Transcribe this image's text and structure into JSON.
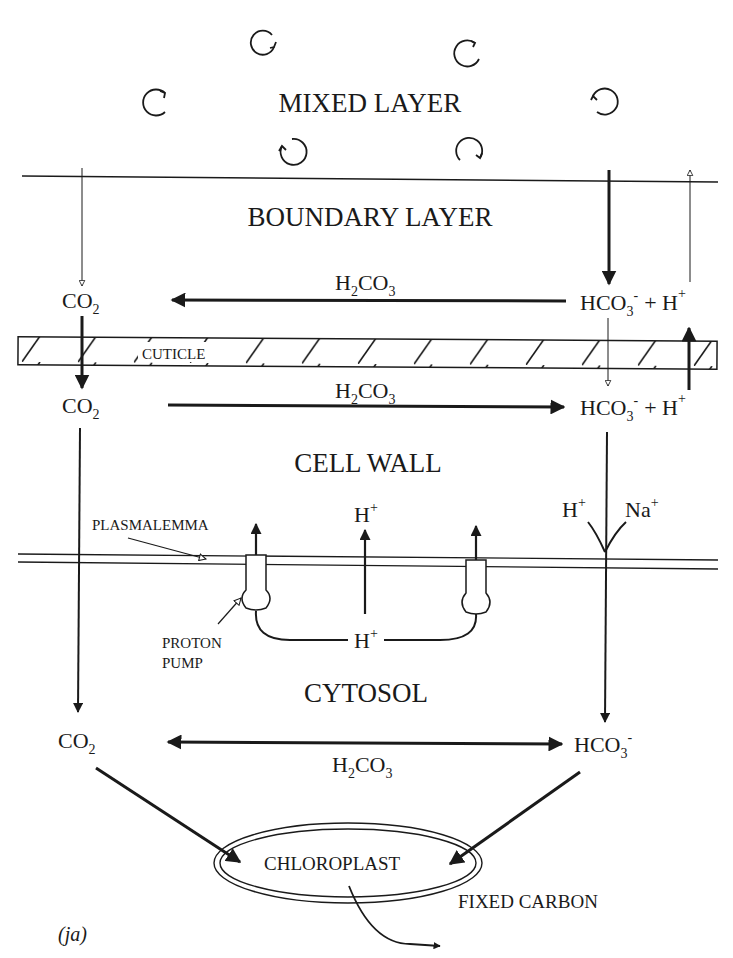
{
  "regions": {
    "mixed_layer": "MIXED LAYER",
    "boundary_layer": "BOUNDARY LAYER",
    "cell_wall": "CELL WALL",
    "cytosol": "CYTOSOL"
  },
  "structures": {
    "cuticle": "CUTICLE",
    "plasmalemma": "PLASMALEMMA",
    "proton_pump_line1": "PROTON",
    "proton_pump_line2": "PUMP",
    "chloroplast": "CHLOROPLAST",
    "fixed_carbon": "FIXED CARBON"
  },
  "species": {
    "co2_main": "CO",
    "co2_sub": "2",
    "h2co3_h": "H",
    "h2co3_sub2": "2",
    "h2co3_co": "CO",
    "h2co3_sub3": "3",
    "hco3_main": "HCO",
    "hco3_sub": "3",
    "hco3_sup": "-",
    "plus": "+ H",
    "h": "H",
    "na": "Na",
    "plus_sup": "+"
  },
  "annotation": "(ja)",
  "colors": {
    "ink": "#1a1a1a",
    "background": "#ffffff"
  }
}
